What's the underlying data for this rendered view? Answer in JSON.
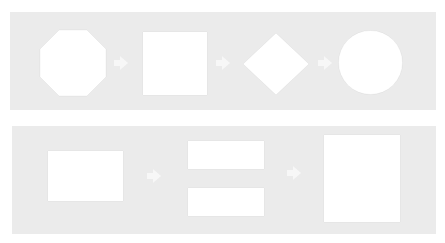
{
  "diagram": {
    "rows": [
      {
        "name": "shape-sequence",
        "shapes": [
          "octagon",
          "square",
          "diamond",
          "circle"
        ],
        "connectors": [
          "arrow-right",
          "arrow-right",
          "arrow-right"
        ]
      },
      {
        "name": "layout-sequence",
        "shapes": [
          "landscape-rectangle",
          "two-stacked-bars",
          "portrait-rectangle"
        ],
        "connectors": [
          "arrow-right",
          "arrow-right"
        ]
      }
    ],
    "colors": {
      "band": "#ebebeb",
      "shape_fill": "#ffffff",
      "arrow": "#f7f7f7",
      "background": "#ffffff"
    }
  }
}
